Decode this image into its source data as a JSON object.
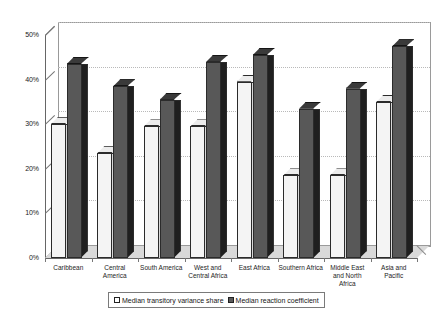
{
  "chart_data": {
    "type": "bar",
    "title": "",
    "subtitle": "",
    "xlabel": "",
    "ylabel": "",
    "ylim": [
      0,
      50
    ],
    "ytick_labels": [
      "0%",
      "10%",
      "20%",
      "30%",
      "40%",
      "50%"
    ],
    "ytick_values": [
      0,
      10,
      20,
      30,
      40,
      50
    ],
    "grid": true,
    "grid_axis": "y",
    "legend_position": "bottom",
    "style": "3d-column",
    "categories": [
      "Caribbean",
      "Central America",
      "South America",
      "West and Central Africa",
      "East Africa",
      "Southern Africa",
      "Middle East and North Africa",
      "Asia and Pacific"
    ],
    "category_lines": [
      [
        "Caribbean"
      ],
      [
        "Central",
        "America"
      ],
      [
        "South America"
      ],
      [
        "West and",
        "Central Africa"
      ],
      [
        "East Africa"
      ],
      [
        "Southern Africa"
      ],
      [
        "Middle East",
        "and North",
        "Africa"
      ],
      [
        "Asia and",
        "Pacific"
      ]
    ],
    "series": [
      {
        "name": "Median transitory variance share",
        "color": "#f4f4f4",
        "values": [
          30,
          23.5,
          29.5,
          29.5,
          39.5,
          18.5,
          18.5,
          35
        ]
      },
      {
        "name": "Median reaction coefficient",
        "color": "#585858",
        "values": [
          43.5,
          38.5,
          35.5,
          44,
          45.5,
          33.5,
          38,
          47.5
        ]
      }
    ]
  },
  "legend": {
    "items": [
      {
        "label": "Median transitory variance share",
        "swatch": "light"
      },
      {
        "label": "Median reaction coefficient",
        "swatch": "dark"
      }
    ]
  }
}
